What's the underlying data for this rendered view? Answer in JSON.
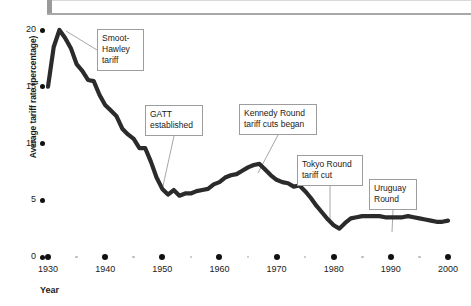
{
  "header": {
    "bar_color": "#a8a8a8"
  },
  "chart_data": {
    "type": "line",
    "title": "",
    "xlabel": "Year",
    "ylabel": "Average tariff rate (percentage)",
    "xlim": [
      1930,
      2000
    ],
    "ylim": [
      0,
      20
    ],
    "grid": false,
    "legend": "none",
    "line_color": "#2b2b2b",
    "xticks": [
      1930,
      1940,
      1950,
      1960,
      1970,
      1980,
      1990,
      2000
    ],
    "xtick_labels": [
      "1930",
      "1940",
      "1950",
      "1960",
      "1970",
      "1980",
      "1990",
      "2000"
    ],
    "xminor_ticks": [
      1935,
      1945,
      1955,
      1965,
      1975,
      1985,
      1995
    ],
    "yticks": [
      0,
      5,
      10,
      15,
      20
    ],
    "ytick_labels": [
      "0",
      "5",
      "10",
      "15",
      "20"
    ],
    "x": [
      1930,
      1931,
      1932,
      1933,
      1934,
      1935,
      1936,
      1937,
      1938,
      1939,
      1940,
      1941,
      1942,
      1943,
      1944,
      1945,
      1946,
      1947,
      1948,
      1949,
      1950,
      1951,
      1952,
      1953,
      1954,
      1955,
      1956,
      1957,
      1958,
      1959,
      1960,
      1961,
      1962,
      1963,
      1964,
      1965,
      1966,
      1967,
      1968,
      1969,
      1970,
      1971,
      1972,
      1973,
      1974,
      1975,
      1976,
      1977,
      1978,
      1979,
      1980,
      1981,
      1982,
      1983,
      1984,
      1985,
      1986,
      1987,
      1988,
      1989,
      1990,
      1991,
      1992,
      1993,
      1994,
      1995,
      1996,
      1997,
      1998,
      1999,
      2000
    ],
    "y": [
      15.0,
      18.5,
      20.0,
      19.3,
      18.4,
      17.0,
      16.4,
      15.6,
      15.5,
      14.3,
      13.4,
      12.9,
      12.4,
      11.3,
      10.8,
      10.4,
      9.6,
      9.6,
      8.4,
      7.0,
      6.0,
      5.5,
      5.9,
      5.4,
      5.6,
      5.6,
      5.8,
      5.9,
      6.0,
      6.4,
      6.6,
      7.0,
      7.2,
      7.3,
      7.6,
      7.9,
      8.1,
      8.2,
      7.7,
      7.2,
      6.8,
      6.6,
      6.5,
      6.2,
      6.3,
      5.8,
      5.2,
      4.5,
      3.9,
      3.3,
      2.8,
      2.5,
      3.0,
      3.4,
      3.5,
      3.6,
      3.6,
      3.6,
      3.6,
      3.5,
      3.5,
      3.5,
      3.5,
      3.6,
      3.5,
      3.4,
      3.3,
      3.2,
      3.1,
      3.1,
      3.2
    ],
    "annotations": [
      {
        "name": "smoot-hawley",
        "text": "Smoot-\nHawley\ntariff",
        "box": {
          "left": 97,
          "top": 29,
          "width": 47,
          "height": 42
        },
        "leader_to": {
          "x": 66,
          "y": 31
        }
      },
      {
        "name": "gatt-established",
        "text": "GATT\nestablished",
        "box": {
          "left": 145,
          "top": 105,
          "width": 58,
          "height": 31
        },
        "leader_to": {
          "x": 163,
          "y": 186
        }
      },
      {
        "name": "kennedy-round",
        "text": "Kennedy Round\ntariff cuts began",
        "box": {
          "left": 239,
          "top": 104,
          "width": 78,
          "height": 31
        },
        "leader_to": {
          "x": 258,
          "y": 173
        }
      },
      {
        "name": "tokyo-round",
        "text": "Tokyo Round\ntariff cut",
        "box": {
          "left": 297,
          "top": 155,
          "width": 66,
          "height": 31
        },
        "leader_to": {
          "x": 330,
          "y": 222
        }
      },
      {
        "name": "uruguay-round",
        "text": "Uruguay\nRound",
        "box": {
          "left": 369,
          "top": 179,
          "width": 48,
          "height": 31
        },
        "leader_to": {
          "x": 392,
          "y": 232
        }
      }
    ]
  }
}
